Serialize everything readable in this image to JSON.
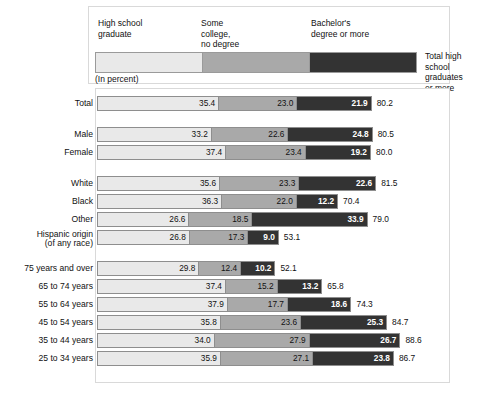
{
  "legend": {
    "categories": [
      {
        "key": "high_school_graduate",
        "label": "High school\ngraduate",
        "color": "#e9e9e9"
      },
      {
        "key": "some_college_no_degree",
        "label": "Some\ncollege,\nno degree",
        "color": "#a9a9a9"
      },
      {
        "key": "bachelors_degree_or_more",
        "label": "Bachelor's\ndegree or more",
        "color": "#333333"
      }
    ],
    "total_label": "Total high school\ngraduates or more"
  },
  "units_note": "(In percent)",
  "chart_data": {
    "type": "bar",
    "subtype": "stacked-horizontal",
    "title": "",
    "xlabel": "",
    "ylabel": "",
    "units": "percent",
    "xlim": [
      0,
      100
    ],
    "grid": false,
    "legend_position": "top",
    "series": [
      {
        "name": "High school graduate",
        "color": "#e9e9e9",
        "values": [
          35.4,
          33.2,
          37.4,
          35.6,
          36.3,
          26.6,
          26.8,
          29.8,
          37.4,
          37.9,
          35.8,
          34.0,
          35.9
        ]
      },
      {
        "name": "Some college, no degree",
        "color": "#a9a9a9",
        "values": [
          23.0,
          22.6,
          23.4,
          23.3,
          22.0,
          18.5,
          17.3,
          12.4,
          15.2,
          17.7,
          23.6,
          27.9,
          27.1
        ]
      },
      {
        "name": "Bachelor's degree or more",
        "color": "#333333",
        "values": [
          21.9,
          24.8,
          19.2,
          22.6,
          12.2,
          33.9,
          9.0,
          10.2,
          13.2,
          18.6,
          25.3,
          26.7,
          23.8
        ]
      }
    ],
    "categories": [
      "Total",
      "Male",
      "Female",
      "White",
      "Black",
      "Other",
      "Hispanic origin\n(of any race)",
      "75 years and over",
      "65 to 74 years",
      "55 to 64 years",
      "45 to 54 years",
      "35 to 44 years",
      "25 to 34 years"
    ],
    "totals": [
      80.2,
      80.5,
      80.0,
      81.5,
      70.4,
      79.0,
      53.1,
      52.1,
      65.8,
      74.3,
      84.7,
      88.6,
      86.7
    ]
  },
  "rows": [
    {
      "label": "Total",
      "two_line": false,
      "group": 0,
      "s1": "35.4",
      "s2": "23.0",
      "s3": "21.9",
      "total": "80.2",
      "v1": 35.4,
      "v2": 23.0,
      "v3": 21.9,
      "vt": 80.2
    },
    {
      "label": "Male",
      "two_line": false,
      "group": 1,
      "s1": "33.2",
      "s2": "22.6",
      "s3": "24.8",
      "total": "80.5",
      "v1": 33.2,
      "v2": 22.6,
      "v3": 24.8,
      "vt": 80.5
    },
    {
      "label": "Female",
      "two_line": false,
      "group": 1,
      "s1": "37.4",
      "s2": "23.4",
      "s3": "19.2",
      "total": "80.0",
      "v1": 37.4,
      "v2": 23.4,
      "v3": 19.2,
      "vt": 80.0
    },
    {
      "label": "White",
      "two_line": false,
      "group": 2,
      "s1": "35.6",
      "s2": "23.3",
      "s3": "22.6",
      "total": "81.5",
      "v1": 35.6,
      "v2": 23.3,
      "v3": 22.6,
      "vt": 81.5
    },
    {
      "label": "Black",
      "two_line": false,
      "group": 2,
      "s1": "36.3",
      "s2": "22.0",
      "s3": "12.2",
      "total": "70.4",
      "v1": 36.3,
      "v2": 22.0,
      "v3": 12.2,
      "vt": 70.4
    },
    {
      "label": "Other",
      "two_line": false,
      "group": 2,
      "s1": "26.6",
      "s2": "18.5",
      "s3": "33.9",
      "total": "79.0",
      "v1": 26.6,
      "v2": 18.5,
      "v3": 33.9,
      "vt": 79.0
    },
    {
      "label": "Hispanic origin\n(of any race)",
      "two_line": true,
      "group": 2,
      "s1": "26.8",
      "s2": "17.3",
      "s3": "9.0",
      "total": "53.1",
      "v1": 26.8,
      "v2": 17.3,
      "v3": 9.0,
      "vt": 53.1
    },
    {
      "label": "75 years and over",
      "two_line": false,
      "group": 3,
      "s1": "29.8",
      "s2": "12.4",
      "s3": "10.2",
      "total": "52.1",
      "v1": 29.8,
      "v2": 12.4,
      "v3": 10.2,
      "vt": 52.1
    },
    {
      "label": "65 to 74 years",
      "two_line": false,
      "group": 3,
      "s1": "37.4",
      "s2": "15.2",
      "s3": "13.2",
      "total": "65.8",
      "v1": 37.4,
      "v2": 15.2,
      "v3": 13.2,
      "vt": 65.8
    },
    {
      "label": "55 to 64 years",
      "two_line": false,
      "group": 3,
      "s1": "37.9",
      "s2": "17.7",
      "s3": "18.6",
      "total": "74.3",
      "v1": 37.9,
      "v2": 17.7,
      "v3": 18.6,
      "vt": 74.3
    },
    {
      "label": "45 to 54 years",
      "two_line": false,
      "group": 3,
      "s1": "35.8",
      "s2": "23.6",
      "s3": "25.3",
      "total": "84.7",
      "v1": 35.8,
      "v2": 23.6,
      "v3": 25.3,
      "vt": 84.7
    },
    {
      "label": "35 to 44 years",
      "two_line": false,
      "group": 3,
      "s1": "34.0",
      "s2": "27.9",
      "s3": "26.7",
      "total": "88.6",
      "v1": 34.0,
      "v2": 27.9,
      "v3": 26.7,
      "vt": 88.6
    },
    {
      "label": "25 to 34 years",
      "two_line": false,
      "group": 3,
      "s1": "35.9",
      "s2": "27.1",
      "s3": "23.8",
      "total": "86.7",
      "v1": 35.9,
      "v2": 27.1,
      "v3": 23.8,
      "vt": 86.7
    }
  ]
}
